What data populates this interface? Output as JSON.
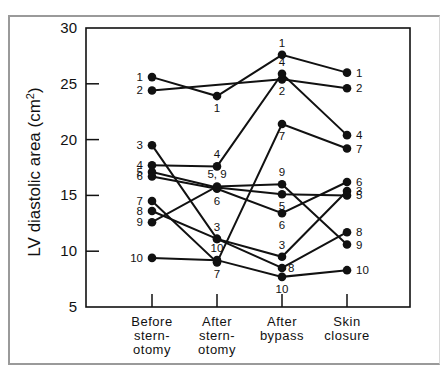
{
  "chart_data": {
    "type": "line",
    "title": "",
    "xlabel": "",
    "ylabel": "LV diastolic area (cm²)",
    "ylabel_parts": {
      "main": "LV diastolic area (cm",
      "sup": "2",
      "end": ")"
    },
    "ylim": [
      5,
      30
    ],
    "yticks": [
      5,
      10,
      15,
      20,
      25,
      30
    ],
    "grid": false,
    "legend": "none (series labeled inline by patient number)",
    "categories": [
      "Before sternotomy",
      "After sternotomy",
      "After bypass",
      "Skin closure"
    ],
    "category_label_lines": [
      [
        "Before",
        "stern-",
        "otomy"
      ],
      [
        "After",
        "stern-",
        "otomy"
      ],
      [
        "After",
        "bypass"
      ],
      [
        "Skin",
        "closure"
      ]
    ],
    "series": [
      {
        "name": "1",
        "values": [
          25.6,
          23.9,
          27.6,
          26.0
        ]
      },
      {
        "name": "2",
        "values": [
          24.4,
          null,
          25.4,
          24.6
        ]
      },
      {
        "name": "3",
        "values": [
          19.5,
          11.1,
          9.5,
          15.4
        ]
      },
      {
        "name": "4",
        "values": [
          17.7,
          17.6,
          25.9,
          20.4
        ]
      },
      {
        "name": "5",
        "values": [
          17.1,
          15.7,
          15.1,
          15.0
        ]
      },
      {
        "name": "6",
        "values": [
          16.7,
          15.6,
          13.4,
          16.2
        ]
      },
      {
        "name": "7",
        "values": [
          14.5,
          9.0,
          21.4,
          19.2
        ]
      },
      {
        "name": "8",
        "values": [
          13.6,
          11.1,
          8.5,
          11.7
        ]
      },
      {
        "name": "9",
        "values": [
          12.6,
          15.8,
          16.0,
          10.6
        ]
      },
      {
        "name": "10",
        "values": [
          9.4,
          9.2,
          7.7,
          8.3
        ]
      }
    ],
    "annotations": {
      "before_labels": [
        "1",
        "2",
        "3",
        "4",
        "5",
        "6",
        "7",
        "8",
        "9",
        "10"
      ],
      "after_sternotomy_labels": [
        {
          "text": "1",
          "pos": "below",
          "value": 23.9
        },
        {
          "text": "4",
          "pos": "above",
          "value": 17.6
        },
        {
          "text": "5, 9",
          "pos": "above",
          "value": 15.8
        },
        {
          "text": "6",
          "pos": "below",
          "value": 15.6
        },
        {
          "text": "3",
          "pos": "above",
          "value": 11.1
        },
        {
          "text": "10",
          "pos": "above",
          "value": 9.2
        },
        {
          "text": "7",
          "pos": "below",
          "value": 9.0
        }
      ],
      "after_bypass_labels": [
        {
          "text": "1",
          "pos": "above",
          "value": 27.6
        },
        {
          "text": "4",
          "pos": "above",
          "value": 25.9
        },
        {
          "text": "2",
          "pos": "below",
          "value": 25.4
        },
        {
          "text": "7",
          "pos": "below",
          "value": 21.4
        },
        {
          "text": "9",
          "pos": "above",
          "value": 16.0
        },
        {
          "text": "5",
          "pos": "below",
          "value": 15.1
        },
        {
          "text": "6",
          "pos": "below",
          "value": 13.4
        },
        {
          "text": "3",
          "pos": "above",
          "value": 9.5
        },
        {
          "text": "8",
          "pos": "right",
          "value": 8.5
        },
        {
          "text": "10",
          "pos": "below",
          "value": 7.7
        }
      ],
      "skin_closure_labels": [
        "1",
        "2",
        "4",
        "7",
        "6",
        "3",
        "5",
        "8",
        "9",
        "10"
      ]
    }
  },
  "colors": {
    "ink": "#111111",
    "frame": "#9a9a9a",
    "background": "#ffffff"
  }
}
